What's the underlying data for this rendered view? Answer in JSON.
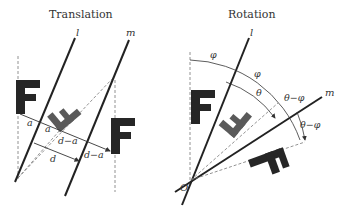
{
  "panels": {
    "translation": {
      "title": "Translation",
      "line_l": "l",
      "line_m": "m",
      "labels": {
        "a1": "a",
        "a2": "a",
        "d": "d",
        "d_minus_a1": "d−a",
        "d_minus_a2": "d−a"
      }
    },
    "rotation": {
      "title": "Rotation",
      "line_l": "l",
      "line_m": "m",
      "origin": "O",
      "labels": {
        "phi1": "φ",
        "phi2": "φ",
        "theta": "θ",
        "theta_minus_phi1": "θ−φ",
        "theta_minus_phi2": "θ−φ"
      }
    }
  },
  "colors": {
    "line": "#222222",
    "dashed": "#777777",
    "letter_dark": "#262626",
    "letter_gray": "#5a5a5a"
  }
}
